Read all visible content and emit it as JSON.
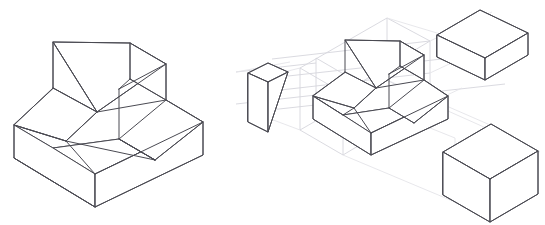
{
  "document": {
    "title": "Isometric Exploded View Technical Drawing",
    "background_color": "#ffffff",
    "width": 545,
    "height": 225
  },
  "style": {
    "solid_edge_color": "#4a4a52",
    "construction_line_color": "#d6d6dc",
    "construction_line_faint_color": "#e4e4e9",
    "face_fill_color": "#ffffff",
    "solid_edge_width": 1,
    "construction_line_width": 0.9
  },
  "views": [
    {
      "name": "assembled-isometric-view",
      "label": "Assembled Isometric View",
      "position": "left",
      "description": "Isometric projection of a machined base block with an inclined front face and an upper step pocket"
    },
    {
      "name": "exploded-isometric-view",
      "label": "Exploded Isometric View",
      "position": "right",
      "description": "Same part shown with removed material pieces displaced along isometric projection axes"
    }
  ],
  "components": [
    {
      "name": "main-body",
      "label": "Main Body",
      "view": "assembled-isometric-view",
      "type": "machined-block"
    },
    {
      "name": "main-body-exploded",
      "label": "Main Body",
      "view": "exploded-isometric-view",
      "type": "machined-block"
    },
    {
      "name": "wedge-piece",
      "label": "Wedge Piece",
      "view": "exploded-isometric-view",
      "type": "triangular-prism"
    },
    {
      "name": "rectangular-block-piece",
      "label": "Rectangular Block Piece",
      "view": "exploded-isometric-view",
      "type": "rectangular-prism"
    },
    {
      "name": "cube-piece",
      "label": "Cube Piece",
      "view": "exploded-isometric-view",
      "type": "cube"
    }
  ],
  "geometry": {
    "assembled": {
      "faces": [
        {
          "name": "base-front-left-face",
          "points": "14,125 14,158 53,181 53,148"
        },
        {
          "name": "base-front-right-face",
          "points": "53,181 53,148 203,155 203,122 203,155"
        },
        {
          "name": "base-top-face",
          "points": "14,125 53,148 203,122 166,100"
        }
      ],
      "outline": "14,125 14,158 95,207 203,155 203,122 166,100 166,64 130,43 53,42 53,88 14,125",
      "edges": [
        "14,125 53,148",
        "53,148 53,181",
        "53,148 203,122",
        "95,207 203,155",
        "14,158 95,207",
        "203,122 203,155"
      ]
    }
  },
  "annotations": {
    "has_text_labels": false,
    "has_dimensions": false,
    "line_style": "visible-edges-solid-construction-lines-light"
  }
}
